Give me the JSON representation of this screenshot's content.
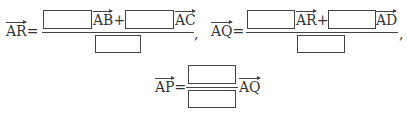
{
  "eq1": {
    "lhs": "AR",
    "eq": "=",
    "v1": "AB",
    "plus": "+",
    "v2": "AC",
    "comma": ","
  },
  "eq2": {
    "lhs": "AQ",
    "eq": "=",
    "v1": "AR",
    "plus": "+",
    "v2": "AD",
    "comma": ","
  },
  "eq3": {
    "lhs": "AP",
    "eq": "=",
    "v1": "AQ"
  }
}
